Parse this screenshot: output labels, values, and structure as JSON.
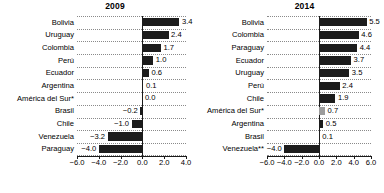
{
  "chart_data": [
    {
      "type": "bar",
      "orientation": "horizontal",
      "title": "2009",
      "xlabel": "",
      "ylabel": "",
      "xlim": [
        -6.0,
        4.0
      ],
      "xticks": [
        -6.0,
        -4.0,
        -2.0,
        0.0,
        2.0,
        4.0
      ],
      "xticklabels": [
        "−6.0",
        "−4.0",
        "−2.0",
        "0.0",
        "2.0",
        "4.0"
      ],
      "grid": "horizontal-dotted",
      "legend": "none",
      "categories": [
        "Bolivia",
        "Uruguay",
        "Colombia",
        "Perú",
        "Ecuador",
        "Argentina",
        "América del Sur*",
        "Brasil",
        "Chile",
        "Venezuela",
        "Paraguay"
      ],
      "values": [
        3.4,
        2.4,
        1.7,
        1.0,
        0.6,
        0.1,
        0.0,
        -0.2,
        -1.0,
        -3.2,
        -4.0
      ],
      "value_labels": [
        "3.4",
        "2.4",
        "1.7",
        "1.0",
        "0.6",
        "0.1",
        "0.0",
        "−0.2",
        "−1.0",
        "−3.2",
        "−4.0"
      ],
      "highlight": "América del Sur*"
    },
    {
      "type": "bar",
      "orientation": "horizontal",
      "title": "2014",
      "xlabel": "",
      "ylabel": "",
      "xlim": [
        -6.0,
        6.0
      ],
      "xticks": [
        -6.0,
        -4.0,
        -2.0,
        0.0,
        2.0,
        4.0,
        6.0
      ],
      "xticklabels": [
        "−6.0",
        "−4.0",
        "−2.0",
        "0.0",
        "2.0",
        "4.0",
        "6.0"
      ],
      "grid": "horizontal-dotted",
      "legend": "none",
      "categories": [
        "Bolivia",
        "Colombia",
        "Paraguay",
        "Ecuador",
        "Uruguay",
        "Perú",
        "Chile",
        "América del Sur*",
        "Argentina",
        "Brasil",
        "Venezuela**"
      ],
      "values": [
        5.5,
        4.6,
        4.4,
        3.7,
        3.5,
        2.4,
        1.9,
        0.7,
        0.5,
        0.1,
        -4.0
      ],
      "value_labels": [
        "5.5",
        "4.6",
        "4.4",
        "3.7",
        "3.5",
        "2.4",
        "1.9",
        "0.7",
        "0.5",
        "0.1",
        "−4.0"
      ],
      "highlight": "América del Sur*"
    }
  ],
  "colors": {
    "bar": "#1c1c1c",
    "bar_highlight": "#9c9c9c",
    "axis": "#1a1a1a",
    "grid": "#8a8a8a",
    "background": "#ffffff"
  }
}
